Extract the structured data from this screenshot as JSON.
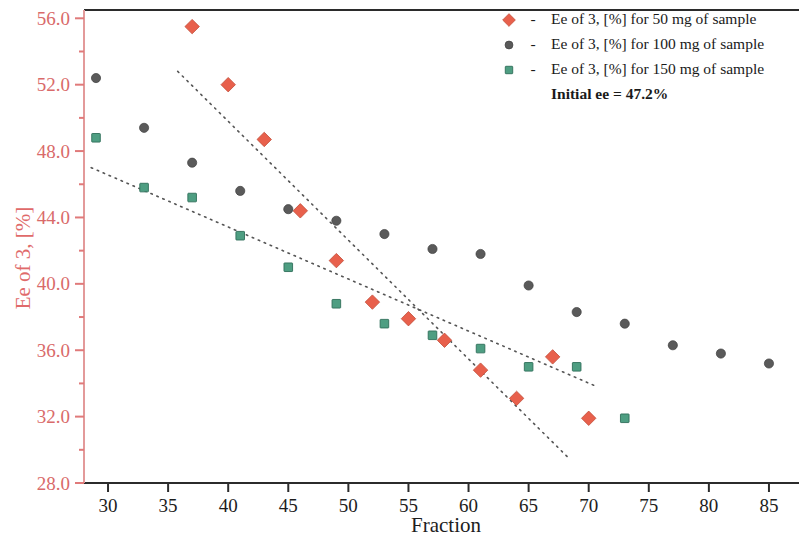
{
  "chart_data": {
    "type": "scatter",
    "title": "",
    "xlabel": "Fraction",
    "ylabel": "Ee of 3, [%]",
    "xlim": [
      28,
      87.5
    ],
    "ylim": [
      28.0,
      56.5
    ],
    "xticks": [
      30,
      35,
      40,
      45,
      50,
      55,
      60,
      65,
      70,
      75,
      80,
      85
    ],
    "yticks": [
      "28.0",
      "32.0",
      "36.0",
      "40.0",
      "44.0",
      "48.0",
      "52.0",
      "56.0"
    ],
    "ytick_values": [
      28.0,
      32.0,
      36.0,
      40.0,
      44.0,
      48.0,
      52.0,
      56.0
    ],
    "grid": false,
    "legend_position": "top-right",
    "annotation": "Initial ee = 47.2%",
    "series": [
      {
        "name": "Ee of 3, [%] for 50 mg of sample",
        "marker": "diamond",
        "color": "#e8604c",
        "points": [
          {
            "x": 37,
            "y": 55.5
          },
          {
            "x": 40,
            "y": 52.0
          },
          {
            "x": 43,
            "y": 48.7
          },
          {
            "x": 46,
            "y": 44.4
          },
          {
            "x": 49,
            "y": 41.4
          },
          {
            "x": 52,
            "y": 38.9
          },
          {
            "x": 55,
            "y": 37.9
          },
          {
            "x": 58,
            "y": 36.6
          },
          {
            "x": 61,
            "y": 34.8
          },
          {
            "x": 64,
            "y": 33.1
          },
          {
            "x": 67,
            "y": 35.6
          },
          {
            "x": 70,
            "y": 31.9
          }
        ]
      },
      {
        "name": "Ee of 3, [%] for 100 mg of sample",
        "marker": "circle",
        "color": "#5a5a5a",
        "points": [
          {
            "x": 29,
            "y": 52.4
          },
          {
            "x": 33,
            "y": 49.4
          },
          {
            "x": 37,
            "y": 47.3
          },
          {
            "x": 41,
            "y": 45.6
          },
          {
            "x": 45,
            "y": 44.5
          },
          {
            "x": 49,
            "y": 43.8
          },
          {
            "x": 53,
            "y": 43.0
          },
          {
            "x": 57,
            "y": 42.1
          },
          {
            "x": 61,
            "y": 41.8
          },
          {
            "x": 65,
            "y": 39.9
          },
          {
            "x": 69,
            "y": 38.3
          },
          {
            "x": 73,
            "y": 37.6
          },
          {
            "x": 77,
            "y": 36.3
          },
          {
            "x": 81,
            "y": 35.8
          },
          {
            "x": 85,
            "y": 35.2
          }
        ]
      },
      {
        "name": "Ee of 3, [%] for 150 mg of sample",
        "marker": "square",
        "color": "#4e9e82",
        "points": [
          {
            "x": 29,
            "y": 48.8
          },
          {
            "x": 33,
            "y": 45.8
          },
          {
            "x": 37,
            "y": 45.2
          },
          {
            "x": 41,
            "y": 42.9
          },
          {
            "x": 45,
            "y": 41.0
          },
          {
            "x": 49,
            "y": 38.8
          },
          {
            "x": 53,
            "y": 37.6
          },
          {
            "x": 57,
            "y": 36.9
          },
          {
            "x": 61,
            "y": 36.1
          },
          {
            "x": 65,
            "y": 35.0
          },
          {
            "x": 69,
            "y": 35.0
          },
          {
            "x": 73,
            "y": 31.9
          }
        ]
      }
    ],
    "trendlines": [
      {
        "name": "trend-50mg",
        "color": "#555555",
        "style": "dotted",
        "x1": 35.8,
        "y1": 52.8,
        "x2": 68.2,
        "y2": 29.6
      },
      {
        "name": "trend-150mg",
        "color": "#555555",
        "style": "dotted",
        "x1": 28.6,
        "y1": 47.0,
        "x2": 70.7,
        "y2": 33.8
      }
    ]
  },
  "legend": {
    "dash": "-",
    "items": [
      {
        "label": "Ee of 3, [%] for 50 mg of sample",
        "marker": "diamond",
        "color": "#e8604c"
      },
      {
        "label": "Ee of 3, [%] for 100 mg of sample",
        "marker": "circle",
        "color": "#5a5a5a"
      },
      {
        "label": "Ee of 3, [%] for 150 mg of sample",
        "marker": "square",
        "color": "#4e9e82"
      }
    ],
    "note": "Initial ee = 47.2%"
  },
  "axes": {
    "y_title": "Ee of 3, [%]",
    "x_title": "Fraction"
  }
}
